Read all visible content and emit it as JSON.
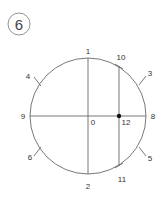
{
  "step": {
    "number": "6"
  },
  "diagram": {
    "stroke_color": "#555555",
    "labels": {
      "p0": "0",
      "p1": "1",
      "p2": "2",
      "p3": "3",
      "p4": "4",
      "p5": "5",
      "p6": "6",
      "p8": "8",
      "p9": "9",
      "p10": "10",
      "p11": "11",
      "p12": "12"
    }
  }
}
